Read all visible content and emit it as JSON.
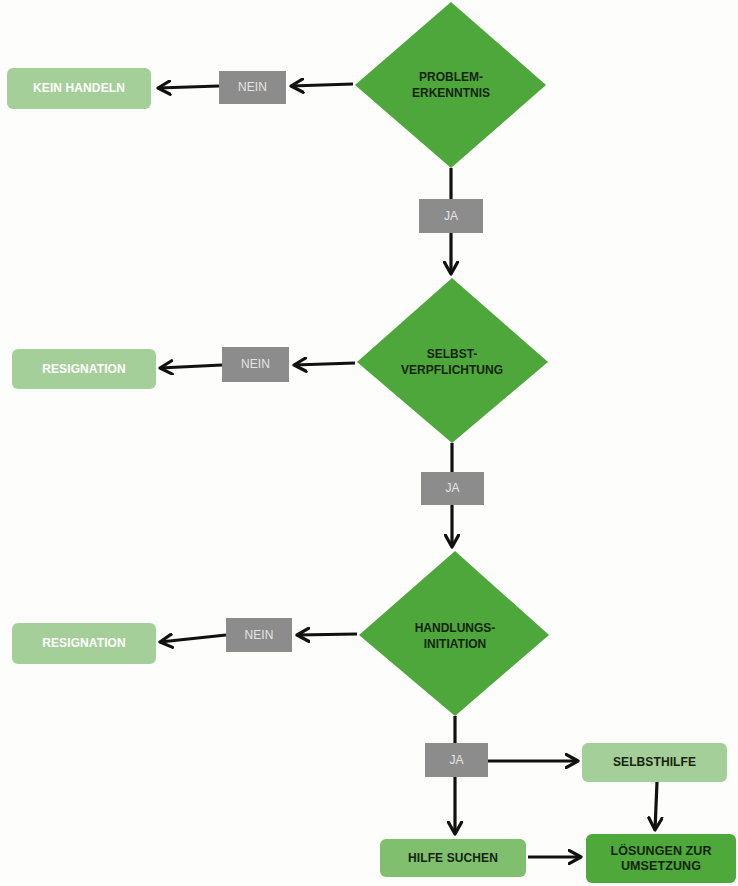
{
  "colors": {
    "decision": "#4ea73a",
    "outcome_light": "#a5cf98",
    "label_gray": "#8c8c8c",
    "step_mid": "#7fbf6e",
    "step_dark": "#4ea83a",
    "arrow": "#111111"
  },
  "decisions": [
    {
      "line1": "PROBLEM-",
      "line2": "ERKENNTNIS"
    },
    {
      "line1": "SELBST-",
      "line2": "VERPFLICHTUNG"
    },
    {
      "line1": "HANDLUNGS-",
      "line2": "INITIATION"
    }
  ],
  "no_labels": [
    "NEIN",
    "NEIN",
    "NEIN"
  ],
  "yes_labels": [
    "JA",
    "JA",
    "JA"
  ],
  "outcomes": [
    "KEIN HANDELN",
    "RESIGNATION",
    "RESIGNATION"
  ],
  "final_steps": {
    "selbsthilfe": "SELBSTHILFE",
    "hilfe_suchen": "HILFE SUCHEN",
    "loesungen_line1": "LÖSUNGEN ZUR",
    "loesungen_line2": "UMSETZUNG"
  }
}
